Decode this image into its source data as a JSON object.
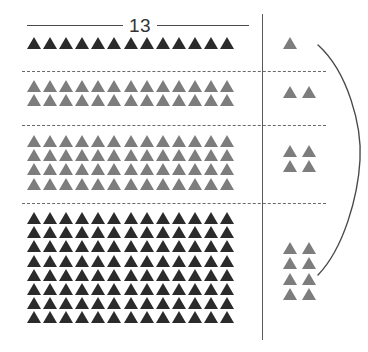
{
  "figure": {
    "group_size_label": "13",
    "base": 13,
    "colors": {
      "dark_triangle": "#2b2b2b",
      "gray_triangle": "#7d7d7d",
      "rule": "#4a4a4a",
      "divider": "#5a5a5a",
      "dashed": "#6a6a6a",
      "brace": "#4a4a4a",
      "background": "#ffffff"
    },
    "icons": {
      "unit": "triangle-icon",
      "divider": "vertical-divider-icon",
      "separator": "dashed-separator-icon",
      "brace": "curly-brace-icon"
    }
  },
  "chart_data": {
    "type": "table",
    "title": "13",
    "xlabel": "",
    "ylabel": "",
    "group_size": 13,
    "categories": [
      "row-1",
      "row-2",
      "row-3",
      "row-4"
    ],
    "series": [
      {
        "name": "left_rows_of_13",
        "values": [
          1,
          2,
          4,
          8
        ]
      },
      {
        "name": "right_leftovers",
        "values": [
          1,
          2,
          4,
          8
        ]
      },
      {
        "name": "left_triangle_total",
        "values": [
          13,
          26,
          52,
          104
        ]
      },
      {
        "name": "row_total",
        "values": [
          14,
          28,
          56,
          112
        ]
      }
    ],
    "rows": [
      {
        "index": 1,
        "shade": "dark",
        "left_rows": 1,
        "left_columns": 13,
        "left_count": 13,
        "right_count": 1,
        "right_columns": 1,
        "right_rows": 1,
        "total": 14
      },
      {
        "index": 2,
        "shade": "gray",
        "left_rows": 2,
        "left_columns": 13,
        "left_count": 26,
        "right_count": 2,
        "right_columns": 2,
        "right_rows": 1,
        "total": 28
      },
      {
        "index": 3,
        "shade": "gray",
        "left_rows": 4,
        "left_columns": 13,
        "left_count": 52,
        "right_count": 4,
        "right_columns": 2,
        "right_rows": 2,
        "total": 56
      },
      {
        "index": 4,
        "shade": "dark",
        "left_rows": 8,
        "left_columns": 13,
        "left_count": 104,
        "right_count": 8,
        "right_columns": 2,
        "right_rows": 4,
        "total": 112
      }
    ],
    "separators": [
      {
        "name": "separator-1",
        "after_group": 1,
        "y": 71
      },
      {
        "name": "separator-2",
        "after_group": 2,
        "y": 125
      },
      {
        "name": "separator-3",
        "after_group": 3,
        "y": 203
      }
    ],
    "grid": false,
    "legend": null
  }
}
